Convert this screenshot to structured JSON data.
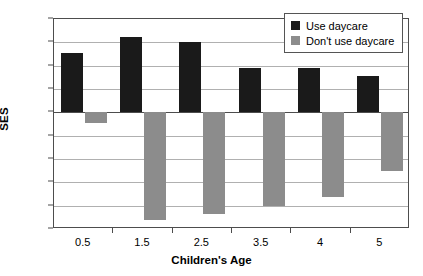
{
  "chart_data": {
    "type": "bar",
    "title": "",
    "xlabel": "Children's Age",
    "ylabel": "SES",
    "categories": [
      "0.5",
      "1.5",
      "2.5",
      "3.5",
      "4",
      "5"
    ],
    "series": [
      {
        "name": "Use daycare",
        "color": "#1a1a1a",
        "values": [
          0.255,
          0.325,
          0.3,
          0.19,
          0.192,
          0.155
        ]
      },
      {
        "name": "Don't use daycare",
        "color": "#8c8c8c",
        "values": [
          -0.045,
          -0.46,
          -0.435,
          -0.4,
          -0.365,
          -0.25
        ]
      }
    ],
    "ylim": [
      -0.5,
      0.4
    ],
    "yticks": [
      0.4,
      0.3,
      0.2,
      0.1,
      0,
      -0.1,
      -0.2,
      -0.3,
      -0.4,
      -0.5
    ],
    "ytick_labels": [
      "0.4",
      "0.3",
      "0.2",
      "0.1",
      "0",
      "-0.1",
      "-0.2",
      "-0.3",
      "-0.4",
      "-0.5"
    ],
    "grid": true,
    "legend_position": "top-right"
  },
  "legend": {
    "items": [
      {
        "label": "Use daycare"
      },
      {
        "label": "Don't use daycare"
      }
    ]
  }
}
